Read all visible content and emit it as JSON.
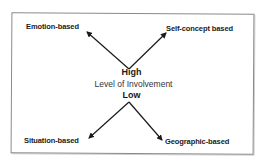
{
  "diagram": {
    "type": "segmentation-bases-by-involvement",
    "center": {
      "top_label": "High",
      "middle_label": "Level of Involvement",
      "bottom_label": "Low"
    },
    "nodes": [
      {
        "id": "emotion",
        "label": "Emotion-based",
        "position": "top-left",
        "involvement": "High"
      },
      {
        "id": "self_concept",
        "label": "Self-concept based",
        "position": "top-right",
        "involvement": "High"
      },
      {
        "id": "situation",
        "label": "Situation-based",
        "position": "bottom-left",
        "involvement": "Low"
      },
      {
        "id": "geographic",
        "label": "Geographic-based",
        "position": "bottom-right",
        "involvement": "Low"
      }
    ],
    "edges": [
      {
        "from": "High",
        "to": "emotion"
      },
      {
        "from": "High",
        "to": "self_concept"
      },
      {
        "from": "Low",
        "to": "situation"
      },
      {
        "from": "Low",
        "to": "geographic"
      }
    ],
    "colors": {
      "text": "#1a1a1a",
      "arrow": "#1a1a1a",
      "border": "#8a8a8a",
      "background": "#ffffff"
    }
  }
}
